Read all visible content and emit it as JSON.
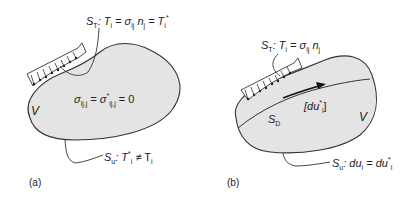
{
  "panel_a": {
    "caption": "(a)",
    "surface_traction_label": {
      "S": "S",
      "sub": "T",
      "rest": ": T",
      "i": "i",
      "eq1": " = σ",
      "ij": "ij",
      "n": " n",
      "j": "j",
      "eq2": " = T",
      "i2": "i",
      "star": "*"
    },
    "equilibrium": {
      "sigma": "σ",
      "sub1": "ij,j",
      "eq": " = σ",
      "star": "*",
      "sub2": "ij,j",
      "rest": " = 0"
    },
    "volume_label": "V",
    "surface_displacement_label": {
      "S": "S",
      "sub": "u",
      "rest": ": T",
      "star": "*",
      "i": "i",
      "neq": " ≠ T",
      "i2": "i"
    }
  },
  "panel_b": {
    "caption": "(b)",
    "surface_traction_label": {
      "S": "S",
      "sub": "T",
      "rest": ": T",
      "i": "i",
      "eq1": " = σ",
      "ij": "ij",
      "n": " n",
      "j": "j"
    },
    "discontinuity_label": {
      "open": "[du",
      "star": "*",
      "i": "i",
      "close": "]"
    },
    "discontinuity_surface": {
      "S": "S",
      "sub": "D"
    },
    "volume_label": "V",
    "surface_displacement_label": {
      "S": "S",
      "sub": "u",
      "rest": ": du",
      "i": "i",
      "eq": " = du",
      "star": "*",
      "i2": "i"
    }
  },
  "colors": {
    "body_fill": "#e4e4e4",
    "stroke": "#333333",
    "text": "#222222"
  }
}
